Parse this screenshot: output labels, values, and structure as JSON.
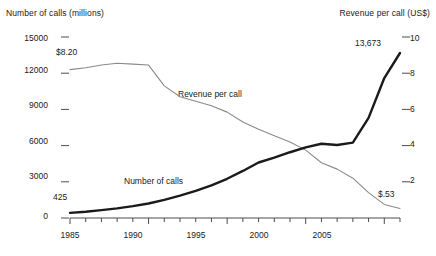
{
  "chart_data": {
    "type": "line",
    "title": "",
    "xlabel": "",
    "ylabel": "Number of calls (millions)",
    "y2label": "Revenue per call (US$)",
    "xlim": [
      1985,
      2006
    ],
    "ylim": [
      0,
      15000
    ],
    "y2lim": [
      0,
      10
    ],
    "grid": false,
    "legend_position": "inline-labels",
    "x_ticks": [
      1985,
      1990,
      1995,
      2000,
      2005
    ],
    "x_minor_ticks": [
      1985,
      1986,
      1987,
      1988,
      1989,
      1990,
      1991,
      1992,
      1993,
      1994,
      1995,
      1996,
      1997,
      1998,
      1999,
      2000,
      2001,
      2002,
      2003,
      2004,
      2005,
      2006
    ],
    "y_ticks": [
      0,
      3000,
      6000,
      9000,
      12000,
      15000
    ],
    "y2_ticks": [
      2,
      4,
      6,
      8,
      10
    ],
    "x": [
      1985,
      1986,
      1987,
      1988,
      1989,
      1990,
      1991,
      1992,
      1993,
      1994,
      1995,
      1996,
      1997,
      1998,
      1999,
      2000,
      2001,
      2002,
      2003,
      2004,
      2005,
      2006
    ],
    "series": [
      {
        "name": "Number of calls",
        "axis": "left",
        "units": "millions",
        "style": "thick-black",
        "values": [
          425,
          520,
          650,
          800,
          980,
          1200,
          1500,
          1850,
          2250,
          2700,
          3250,
          3900,
          4600,
          5000,
          5450,
          5850,
          6150,
          6050,
          6250,
          8300,
          11600,
          13673
        ]
      },
      {
        "name": "Revenue per call",
        "axis": "right",
        "units": "US$",
        "style": "thin-gray",
        "values": [
          8.2,
          8.3,
          8.45,
          8.55,
          8.5,
          8.45,
          7.3,
          6.7,
          6.45,
          6.2,
          5.85,
          5.3,
          4.9,
          4.55,
          4.2,
          3.75,
          3.05,
          2.7,
          2.2,
          1.4,
          0.75,
          0.53
        ]
      }
    ],
    "annotations": [
      {
        "text": "$8.20",
        "series": "Revenue per call",
        "at_x": 1985,
        "at_y": 8.2
      },
      {
        "text": "425",
        "series": "Number of calls",
        "at_x": 1985,
        "at_y": 425
      },
      {
        "text": "13,673",
        "series": "Number of calls",
        "at_x": 2006,
        "at_y": 13673
      },
      {
        "text": "$.53",
        "series": "Revenue per call",
        "at_x": 2006,
        "at_y": 0.53
      }
    ]
  },
  "axes": {
    "left_title": "Number of calls (millions)",
    "right_title": "Revenue per call (US$)",
    "y_left": [
      "15000",
      "12000",
      "9000",
      "6000",
      "3000",
      "0"
    ],
    "y_right": [
      "10",
      "8",
      "6",
      "4",
      "2"
    ],
    "x": [
      "1985",
      "1990",
      "1995",
      "2000",
      "2005"
    ]
  },
  "series_labels": {
    "revenue": "Revenue per call",
    "calls": "Number of calls"
  },
  "annotations": {
    "start_revenue": "$8.20",
    "start_calls": "425",
    "end_calls": "13,673",
    "end_revenue": "$.53"
  },
  "colors": {
    "calls_line": "#1a1a1a",
    "revenue_line": "#8a8a8a",
    "axis": "#4d4d4d",
    "background": "#ffffff"
  }
}
